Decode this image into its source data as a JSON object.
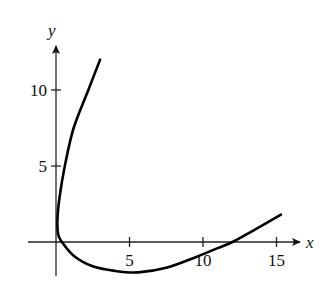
{
  "chart_data": {
    "type": "line",
    "title": "",
    "xlabel": "x",
    "ylabel": "y",
    "xlim": [
      -2,
      16.5
    ],
    "ylim": [
      -3,
      13
    ],
    "grid": false,
    "legend": null,
    "x_ticks": [
      5,
      10,
      15
    ],
    "y_ticks": [
      5,
      10
    ],
    "x_tick_labels": [
      "5",
      "10",
      "15"
    ],
    "y_tick_labels": [
      "5",
      "10"
    ],
    "series": [
      {
        "name": "parametric curve",
        "points": [
          [
            3.0,
            12.0
          ],
          [
            2.2,
            10.0
          ],
          [
            1.2,
            7.5
          ],
          [
            0.6,
            5.0
          ],
          [
            0.25,
            3.0
          ],
          [
            0.1,
            1.5
          ],
          [
            0.15,
            0.5
          ],
          [
            0.4,
            0.0
          ],
          [
            1.2,
            -0.9
          ],
          [
            2.5,
            -1.6
          ],
          [
            4.0,
            -1.9
          ],
          [
            5.6,
            -2.0
          ],
          [
            7.5,
            -1.7
          ],
          [
            9.5,
            -1.0
          ],
          [
            11.0,
            -0.4
          ],
          [
            12.0,
            0.0
          ],
          [
            13.5,
            0.8
          ],
          [
            15.3,
            1.8
          ]
        ]
      }
    ]
  }
}
